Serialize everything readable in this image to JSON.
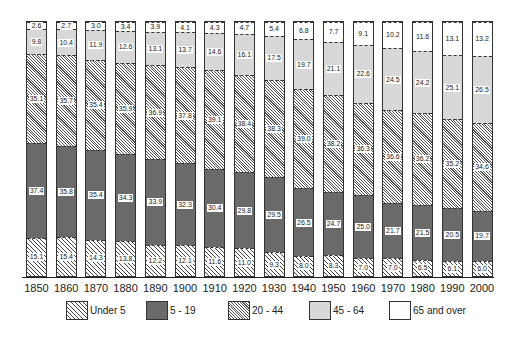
{
  "chart_data": {
    "type": "bar",
    "stacked": true,
    "normalized": true,
    "title": "",
    "xlabel": "",
    "ylabel": "",
    "ylim": [
      0,
      100
    ],
    "grid": false,
    "legend_position": "bottom",
    "categories": [
      "1850",
      "1860",
      "1870",
      "1880",
      "1890",
      "1900",
      "1910",
      "1920",
      "1930",
      "1940",
      "1950",
      "1960",
      "1970",
      "1980",
      "1990",
      "2000"
    ],
    "series": [
      {
        "name": "Under 5",
        "pattern": "wide-diagonal-hatch",
        "values": [
          15.1,
          15.4,
          14.3,
          13.8,
          12.2,
          12.1,
          11.6,
          11.0,
          9.3,
          8.0,
          8.3,
          7.0,
          7.0,
          6.5,
          6.1,
          6.0
        ]
      },
      {
        "name": "5 - 19",
        "pattern": "dark-stipple",
        "values": [
          37.4,
          35.8,
          35.4,
          34.3,
          33.9,
          32.3,
          30.4,
          29.8,
          29.5,
          26.5,
          24.7,
          25.0,
          21.7,
          21.5,
          20.5,
          19.7
        ]
      },
      {
        "name": "20 - 44",
        "pattern": "fine-diagonal-hatch",
        "values": [
          35.1,
          35.7,
          35.4,
          35.9,
          36.9,
          37.8,
          39.1,
          38.4,
          38.3,
          39.0,
          38.2,
          36.3,
          36.6,
          36.2,
          35.2,
          34.6
        ]
      },
      {
        "name": "45 - 64",
        "pattern": "light-stipple",
        "values": [
          9.8,
          10.4,
          11.9,
          12.6,
          13.1,
          13.7,
          14.6,
          16.1,
          17.5,
          19.7,
          21.1,
          22.6,
          24.5,
          24.2,
          25.1,
          26.5
        ]
      },
      {
        "name": "65 and over",
        "pattern": "white",
        "values": [
          2.6,
          2.7,
          3.0,
          3.4,
          3.9,
          4.1,
          4.3,
          4.7,
          5.4,
          6.8,
          7.7,
          9.1,
          10.2,
          11.6,
          13.1,
          13.2
        ]
      }
    ]
  },
  "legend": {
    "items": [
      "Under 5",
      "5 - 19",
      "20 - 44",
      "45 - 64",
      "65 and over"
    ]
  },
  "colors": {
    "axis": "#222222",
    "dark_segment": "#6a6a6a",
    "light_segment": "#d8d8d8"
  }
}
